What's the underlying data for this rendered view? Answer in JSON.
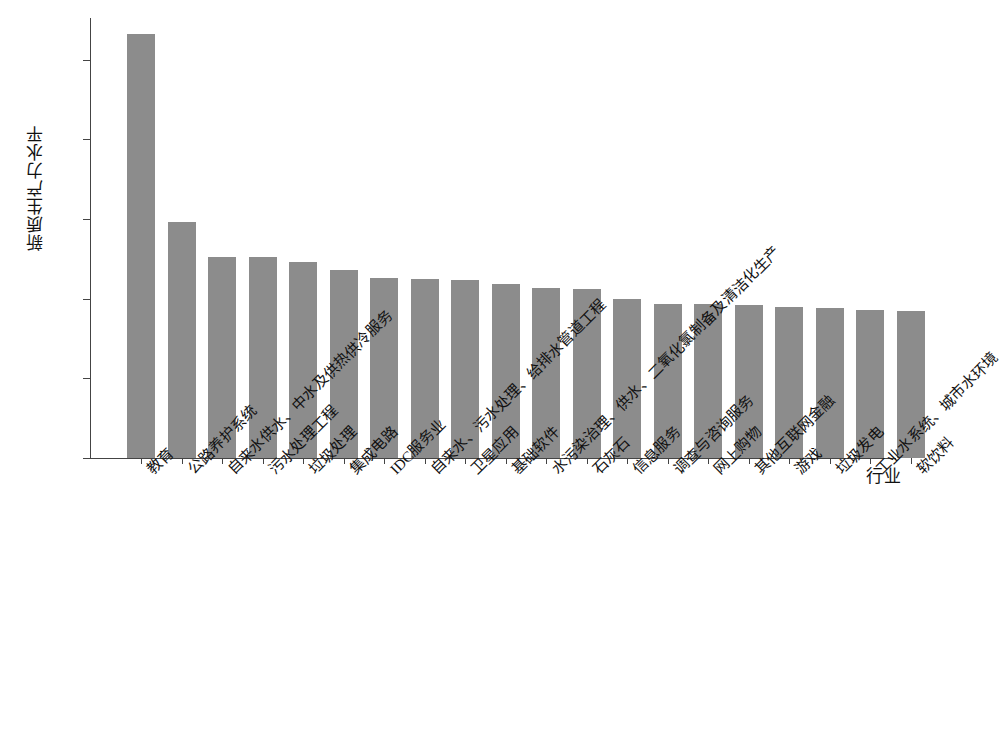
{
  "chart_data": {
    "type": "bar",
    "title": "",
    "xlabel": "行业",
    "ylabel": "新质生产力水平",
    "ylim": [
      0,
      27.5
    ],
    "yticks": [
      0,
      5,
      10,
      15,
      20,
      25
    ],
    "grid": false,
    "legend": null,
    "bar_color": "#8c8c8c",
    "categories": [
      "教育",
      "公路养护系统",
      "自来水供水、中水及供热供冷服务",
      "污水处理工程",
      "垃圾处理",
      "集成电路",
      "IDC服务业",
      "自来水、污水处理、给排水管道工程",
      "卫星应用",
      "基础软件",
      "水污染治理、供水、二氧化氯制备及清洁化生产",
      "石灰石",
      "信息服务",
      "调查与咨询服务",
      "网上购物",
      "其他互联网金融",
      "游戏",
      "垃圾发电",
      "工业水系统、城市水环境",
      "软饮料"
    ],
    "values": [
      26.6,
      14.8,
      12.6,
      12.6,
      12.3,
      11.8,
      11.3,
      11.25,
      11.2,
      10.9,
      10.7,
      10.6,
      10.0,
      9.7,
      9.65,
      9.6,
      9.5,
      9.45,
      9.3,
      9.2
    ]
  }
}
